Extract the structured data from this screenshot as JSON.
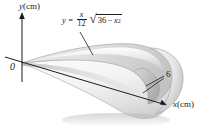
{
  "figure": {
    "background_color": "#ffffff",
    "ink_color": "#1b1b1b",
    "surface_light": "#f2f2f2",
    "surface_mid": "#dcdcdc",
    "surface_dark": "#b9b9b9"
  },
  "equation": {
    "lhs": "y",
    "equals": "=",
    "fraction_numerator": "x",
    "fraction_denominator": "12",
    "radical_sign": "√",
    "radicand_first": "36",
    "radicand_minus": "−",
    "radicand_var": "x",
    "radicand_exponent": "2",
    "plain_text": "y = (x/12)√(36 − x²)"
  },
  "axes": {
    "y_axis": {
      "variable": "y",
      "unit": "(cm)"
    },
    "x_axis": {
      "variable": "x",
      "unit": "(cm)"
    },
    "origin_label": "0"
  },
  "annotations": {
    "x_intercept_label": "6"
  }
}
